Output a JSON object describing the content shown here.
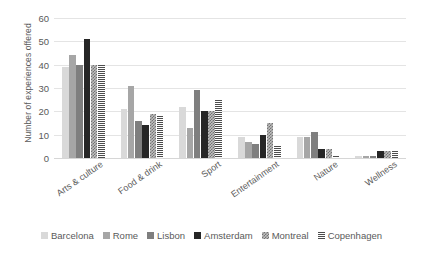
{
  "chart_data": {
    "type": "bar",
    "title": "",
    "xlabel": "",
    "ylabel": "Number of experiences offered",
    "ylim": [
      0,
      60
    ],
    "yticks": [
      0,
      10,
      20,
      30,
      40,
      50,
      60
    ],
    "grid": true,
    "legend_position": "bottom",
    "categories": [
      "Arts & culture",
      "Food & drink",
      "Sport",
      "Entertainment",
      "Nature",
      "Wellness"
    ],
    "series": [
      {
        "name": "Barcelona",
        "color": "#d9d9d9",
        "pattern": "solid-light",
        "values": [
          39,
          21,
          22,
          9,
          9,
          1
        ]
      },
      {
        "name": "Rome",
        "color": "#a6a6a6",
        "pattern": "solid-mid",
        "values": [
          44,
          31,
          13,
          7,
          9,
          1
        ]
      },
      {
        "name": "Lisbon",
        "color": "#7f7f7f",
        "pattern": "solid-dark",
        "values": [
          40,
          16,
          29,
          6,
          11,
          1
        ]
      },
      {
        "name": "Amsterdam",
        "color": "#262626",
        "pattern": "solid-black",
        "values": [
          51,
          14,
          20,
          10,
          4,
          3
        ]
      },
      {
        "name": "Montreal",
        "color": "#bfbfbf",
        "pattern": "checker",
        "values": [
          40,
          19,
          20,
          15,
          4,
          3
        ]
      },
      {
        "name": "Copenhagen",
        "color": "#4d4d4d",
        "pattern": "horiz-lines",
        "values": [
          40,
          18,
          25,
          5,
          1,
          3
        ]
      }
    ]
  },
  "axis": {
    "y_title": "Number of experiences offered"
  }
}
